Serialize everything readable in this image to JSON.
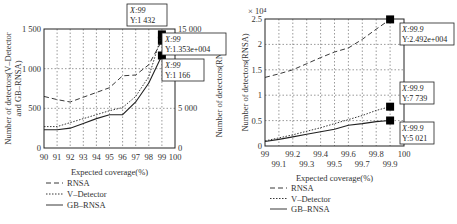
{
  "chart_data": [
    {
      "type": "line",
      "panel": "left",
      "xlabel": "Expected coverage(%)",
      "ylabel_left": "Number of detectors(V-Detector and GB-RNSA)",
      "ylabel_right": "Number of detectors(RNSA)",
      "x": [
        90,
        91,
        92,
        93,
        94,
        95,
        96,
        97,
        98,
        99
      ],
      "x_ticks": [
        "90",
        "91",
        "92",
        "93",
        "94",
        "95",
        "96",
        "97",
        "98",
        "99",
        "100"
      ],
      "y_ticks_left": [
        "0",
        "500",
        "1 000",
        "1 500"
      ],
      "y_ticks_right": [
        "0",
        "5 000",
        "10 000",
        "15 000"
      ],
      "ylim_left": [
        0,
        1500
      ],
      "ylim_right": [
        0,
        15000
      ],
      "grid": true,
      "series": [
        {
          "name": "RNSA",
          "style": "dashed",
          "axis": "right",
          "values": [
            6500,
            6100,
            5800,
            6400,
            7000,
            7600,
            9100,
            9200,
            10500,
            13530
          ]
        },
        {
          "name": "V-Detector",
          "style": "dotted",
          "axis": "left",
          "values": [
            270,
            270,
            320,
            370,
            420,
            470,
            510,
            650,
            900,
            1432
          ]
        },
        {
          "name": "GB-RNSA",
          "style": "solid",
          "axis": "left",
          "values": [
            230,
            230,
            250,
            310,
            370,
            420,
            420,
            580,
            820,
            1166
          ]
        }
      ],
      "annotations": [
        {
          "x_label": "X:99",
          "y_label": "Y:1 432"
        },
        {
          "x_label": "X:99",
          "y_label": "Y:1.353e+004"
        },
        {
          "x_label": "X:99",
          "y_label": "Y:1 166"
        }
      ],
      "legend": [
        "RNSA",
        "V-Detector",
        "GB-RNSA"
      ],
      "legend_position": "below"
    },
    {
      "type": "line",
      "panel": "right",
      "xlabel": "Expected coverage(%)",
      "ylabel": "Number of detectors(RNSA)",
      "y_multiplier": "× 10⁴",
      "x": [
        99.0,
        99.1,
        99.2,
        99.3,
        99.4,
        99.5,
        99.6,
        99.7,
        99.8,
        99.9
      ],
      "x_ticks_top": [
        "99",
        "99.2",
        "99.4",
        "99.6",
        "99.8",
        "100"
      ],
      "x_ticks_bottom": [
        "99.1",
        "99.3",
        "99.5",
        "99.7",
        "99.9"
      ],
      "y_ticks": [
        "0",
        "0.5",
        "1",
        "1.5",
        "2",
        "2.5"
      ],
      "ylim": [
        0,
        2.5
      ],
      "grid": true,
      "series": [
        {
          "name": "RNSA",
          "style": "dashed",
          "values": [
            1.35,
            1.42,
            1.5,
            1.62,
            1.74,
            1.85,
            1.93,
            2.1,
            2.3,
            2.492
          ]
        },
        {
          "name": "V-Detector",
          "style": "dotted",
          "values": [
            0.1,
            0.16,
            0.22,
            0.29,
            0.36,
            0.44,
            0.52,
            0.6,
            0.7,
            0.7739
          ]
        },
        {
          "name": "GB-RNSA",
          "style": "solid",
          "values": [
            0.09,
            0.13,
            0.18,
            0.23,
            0.28,
            0.33,
            0.41,
            0.44,
            0.48,
            0.5021
          ]
        }
      ],
      "annotations": [
        {
          "x_label": "X:99.9",
          "y_label": "Y:2.492e+004"
        },
        {
          "x_label": "X:99.9",
          "y_label": "Y:7 739"
        },
        {
          "x_label": "X:99.9",
          "y_label": "Y:5 021"
        }
      ],
      "legend": [
        "RNSA",
        "V-Detector",
        "GB-RNSA"
      ],
      "legend_position": "below"
    }
  ]
}
